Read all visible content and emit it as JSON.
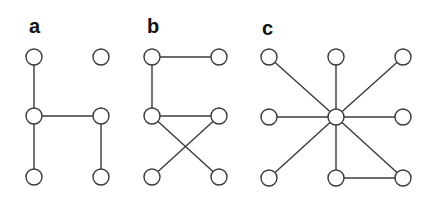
{
  "figure": {
    "panels": [
      {
        "label": "a",
        "label_pos": [
          29,
          16
        ],
        "nodes": [
          {
            "id": "TL",
            "x": 34,
            "y": 57
          },
          {
            "id": "TR",
            "x": 101,
            "y": 57
          },
          {
            "id": "ML",
            "x": 34,
            "y": 116
          },
          {
            "id": "MR",
            "x": 101,
            "y": 116
          },
          {
            "id": "BL",
            "x": 34,
            "y": 177
          },
          {
            "id": "BR",
            "x": 101,
            "y": 177
          }
        ],
        "edges": [
          [
            "TL",
            "ML"
          ],
          [
            "ML",
            "MR"
          ],
          [
            "ML",
            "BL"
          ],
          [
            "MR",
            "BR"
          ]
        ]
      },
      {
        "label": "b",
        "label_pos": [
          147,
          16
        ],
        "nodes": [
          {
            "id": "TL",
            "x": 152,
            "y": 57
          },
          {
            "id": "TR",
            "x": 219,
            "y": 57
          },
          {
            "id": "ML",
            "x": 152,
            "y": 116
          },
          {
            "id": "MR",
            "x": 219,
            "y": 116
          },
          {
            "id": "BL",
            "x": 152,
            "y": 177
          },
          {
            "id": "BR",
            "x": 219,
            "y": 177
          }
        ],
        "edges": [
          [
            "TL",
            "TR"
          ],
          [
            "TL",
            "ML"
          ],
          [
            "ML",
            "MR"
          ],
          [
            "ML",
            "BR"
          ],
          [
            "MR",
            "BL"
          ]
        ]
      },
      {
        "label": "c",
        "label_pos": [
          262,
          18
        ],
        "nodes": [
          {
            "id": "TL",
            "x": 269,
            "y": 57
          },
          {
            "id": "TC",
            "x": 336,
            "y": 57
          },
          {
            "id": "TR",
            "x": 403,
            "y": 57
          },
          {
            "id": "ML",
            "x": 269,
            "y": 117
          },
          {
            "id": "C",
            "x": 336,
            "y": 117
          },
          {
            "id": "MR",
            "x": 403,
            "y": 117
          },
          {
            "id": "BL",
            "x": 269,
            "y": 178
          },
          {
            "id": "BC",
            "x": 336,
            "y": 178
          },
          {
            "id": "BR",
            "x": 403,
            "y": 178
          }
        ],
        "edges": [
          [
            "C",
            "TL"
          ],
          [
            "C",
            "TC"
          ],
          [
            "C",
            "TR"
          ],
          [
            "C",
            "ML"
          ],
          [
            "C",
            "MR"
          ],
          [
            "C",
            "BL"
          ],
          [
            "C",
            "BC"
          ],
          [
            "C",
            "BR"
          ],
          [
            "BC",
            "BR"
          ]
        ]
      }
    ],
    "node_radius": 8,
    "stroke_color": "#3a3a3a",
    "fill_color": "#ffffff"
  }
}
